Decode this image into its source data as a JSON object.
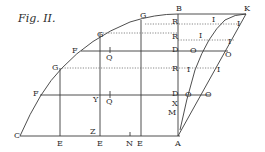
{
  "figure": {
    "title": "Fig. II.",
    "labels": {
      "C": "C",
      "A": "A",
      "B": "B",
      "K": "K",
      "E1": "E",
      "E2": "E",
      "E3": "E",
      "N": "N",
      "Z": "Z",
      "Y": "Y",
      "X": "X",
      "M": "M",
      "F1": "F",
      "F2": "F",
      "F3": "F",
      "G1": "G",
      "G2": "G",
      "G3": "G",
      "G4": "G",
      "R1": "R",
      "R2": "R",
      "R3": "R",
      "D1": "D",
      "D2": "D",
      "Q1": "Q",
      "Q2": "Q",
      "I1": "I",
      "I2": "I",
      "I3": "I",
      "I4": "I",
      "I5": "I",
      "I6": "I",
      "I7": "I",
      "O1": "O",
      "O2": "O",
      "O3": "O",
      "O4": "O"
    },
    "colors": {
      "ink": "#2a2a2a",
      "background": "#ffffff"
    }
  }
}
